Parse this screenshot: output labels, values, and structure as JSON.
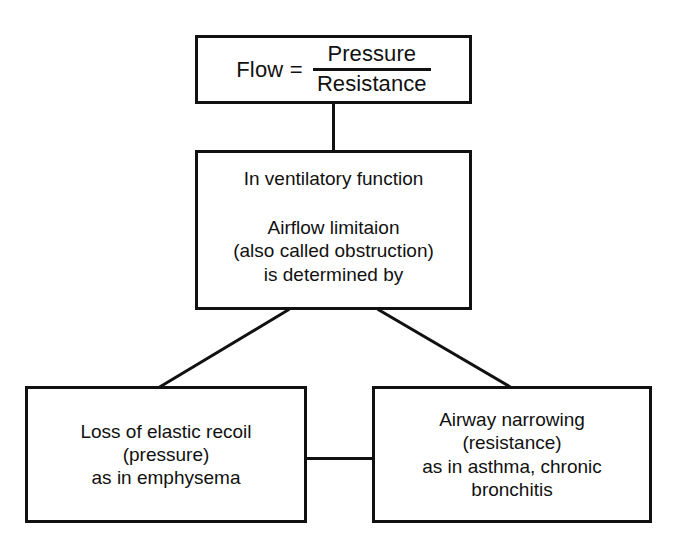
{
  "diagram": {
    "background_color": "#ffffff",
    "line_color": "#111111",
    "nodes": {
      "equation": {
        "lhs": "Flow =",
        "numerator": "Pressure",
        "denominator": "Resistance"
      },
      "middle": {
        "line1": "In ventilatory function",
        "line2": "Airflow limitaion",
        "line3": "(also called obstruction)",
        "line4": "is determined by"
      },
      "recoil": {
        "line1": "Loss of elastic recoil",
        "line2": "(pressure)",
        "line3": "as in emphysema"
      },
      "airway": {
        "line1": "Airway narrowing",
        "line2": "(resistance)",
        "line3": "as in asthma, chronic",
        "line4": "bronchitis"
      }
    },
    "connectors": [
      {
        "name": "equation-to-middle",
        "kind": "vertical"
      },
      {
        "name": "middle-to-recoil",
        "kind": "diagonal"
      },
      {
        "name": "middle-to-airway",
        "kind": "diagonal"
      },
      {
        "name": "recoil-to-airway",
        "kind": "horizontal"
      }
    ]
  }
}
